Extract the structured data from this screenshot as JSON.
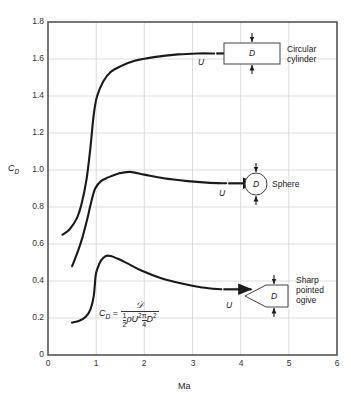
{
  "chart_data": {
    "type": "line",
    "title": "",
    "xlabel": "Ma",
    "ylabel": "C_D",
    "xlim": [
      0,
      6
    ],
    "ylim": [
      0,
      1.8
    ],
    "xticks": [
      "0",
      "1",
      "2",
      "3",
      "4",
      "5",
      "6"
    ],
    "yticks": [
      "0",
      "0.2",
      "0.4",
      "0.6",
      "0.8",
      "1.0",
      "1.2",
      "1.4",
      "1.6",
      "1.8"
    ],
    "grid": true,
    "legend_position": "inline-right-annotations",
    "series": [
      {
        "name": "Circular cylinder",
        "points": [
          [
            0.3,
            0.65
          ],
          [
            0.45,
            0.68
          ],
          [
            0.6,
            0.74
          ],
          [
            0.7,
            0.82
          ],
          [
            0.8,
            0.95
          ],
          [
            0.88,
            1.12
          ],
          [
            0.95,
            1.3
          ],
          [
            1.02,
            1.4
          ],
          [
            1.15,
            1.48
          ],
          [
            1.3,
            1.53
          ],
          [
            1.5,
            1.56
          ],
          [
            1.8,
            1.59
          ],
          [
            2.2,
            1.61
          ],
          [
            2.7,
            1.625
          ],
          [
            3.1,
            1.63
          ],
          [
            3.45,
            1.63
          ]
        ]
      },
      {
        "name": "Sphere",
        "points": [
          [
            0.5,
            0.48
          ],
          [
            0.62,
            0.56
          ],
          [
            0.72,
            0.64
          ],
          [
            0.82,
            0.74
          ],
          [
            0.9,
            0.83
          ],
          [
            0.98,
            0.9
          ],
          [
            1.1,
            0.94
          ],
          [
            1.25,
            0.96
          ],
          [
            1.45,
            0.98
          ],
          [
            1.7,
            0.99
          ],
          [
            2.0,
            0.975
          ],
          [
            2.4,
            0.955
          ],
          [
            2.9,
            0.94
          ],
          [
            3.3,
            0.932
          ],
          [
            3.7,
            0.928
          ]
        ]
      },
      {
        "name": "Sharp pointed ogive",
        "points": [
          [
            0.5,
            0.175
          ],
          [
            0.65,
            0.185
          ],
          [
            0.78,
            0.205
          ],
          [
            0.88,
            0.245
          ],
          [
            0.95,
            0.32
          ],
          [
            0.99,
            0.43
          ],
          [
            1.03,
            0.47
          ],
          [
            1.1,
            0.51
          ],
          [
            1.2,
            0.535
          ],
          [
            1.3,
            0.535
          ],
          [
            1.45,
            0.52
          ],
          [
            1.65,
            0.495
          ],
          [
            1.95,
            0.455
          ],
          [
            2.35,
            0.415
          ],
          [
            2.8,
            0.385
          ],
          [
            3.2,
            0.365
          ],
          [
            3.6,
            0.355
          ]
        ]
      }
    ],
    "annotations": [
      {
        "name": "circular-cylinder",
        "label": "Circular\ncylinder",
        "label_line1": "Circular",
        "label_line2": "cylinder",
        "shape": "rectangle",
        "diameter_symbol": "D",
        "velocity_symbol": "U",
        "at_cd": 1.63
      },
      {
        "name": "sphere",
        "label": "Sphere",
        "label_line1": "Sphere",
        "label_line2": "",
        "shape": "circle",
        "diameter_symbol": "D",
        "velocity_symbol": "U",
        "at_cd": 0.93
      },
      {
        "name": "sharp-pointed-ogive",
        "label": "Sharp pointed ogive",
        "label_line1": "Sharp",
        "label_line2": "pointed",
        "label_line3": "ogive",
        "shape": "ogive",
        "diameter_symbol": "D",
        "velocity_symbol": "U",
        "at_cd": 0.35
      }
    ],
    "formula": {
      "lhs": "C_D",
      "equals": "=",
      "numerator": "𝒟",
      "denominator_half": "1/2",
      "denominator_rho": "ρ",
      "denominator_u": "U",
      "denominator_u_exp": "2",
      "denominator_pi_over_4": "π/4",
      "denominator_d": "D",
      "denominator_d_exp": "2",
      "text": "C_D = D / ( (1/2) ρ U^2 (π/4) D^2 )"
    },
    "colors": {
      "curve": "#1a1a1a",
      "grid": "#d8d8d8",
      "axis": "#555555",
      "background": "#ffffff",
      "text": "#222222"
    }
  }
}
